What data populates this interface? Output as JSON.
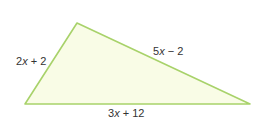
{
  "triangle": {
    "vertices": {
      "top": [
        77,
        23
      ],
      "bottom_left": [
        25,
        104
      ],
      "bottom_right": [
        250,
        104
      ]
    },
    "fill_color": "#f9fce6",
    "stroke_color": "#a8d26a",
    "sides": {
      "left": {
        "label": "2x + 2",
        "coef": "2",
        "var": "x",
        "rest": " + 2"
      },
      "top_right": {
        "label": "5x − 2",
        "coef": "5",
        "var": "x",
        "rest": " − 2"
      },
      "bottom": {
        "label": "3x + 12",
        "coef": "3",
        "var": "x",
        "rest": " + 12"
      }
    }
  }
}
